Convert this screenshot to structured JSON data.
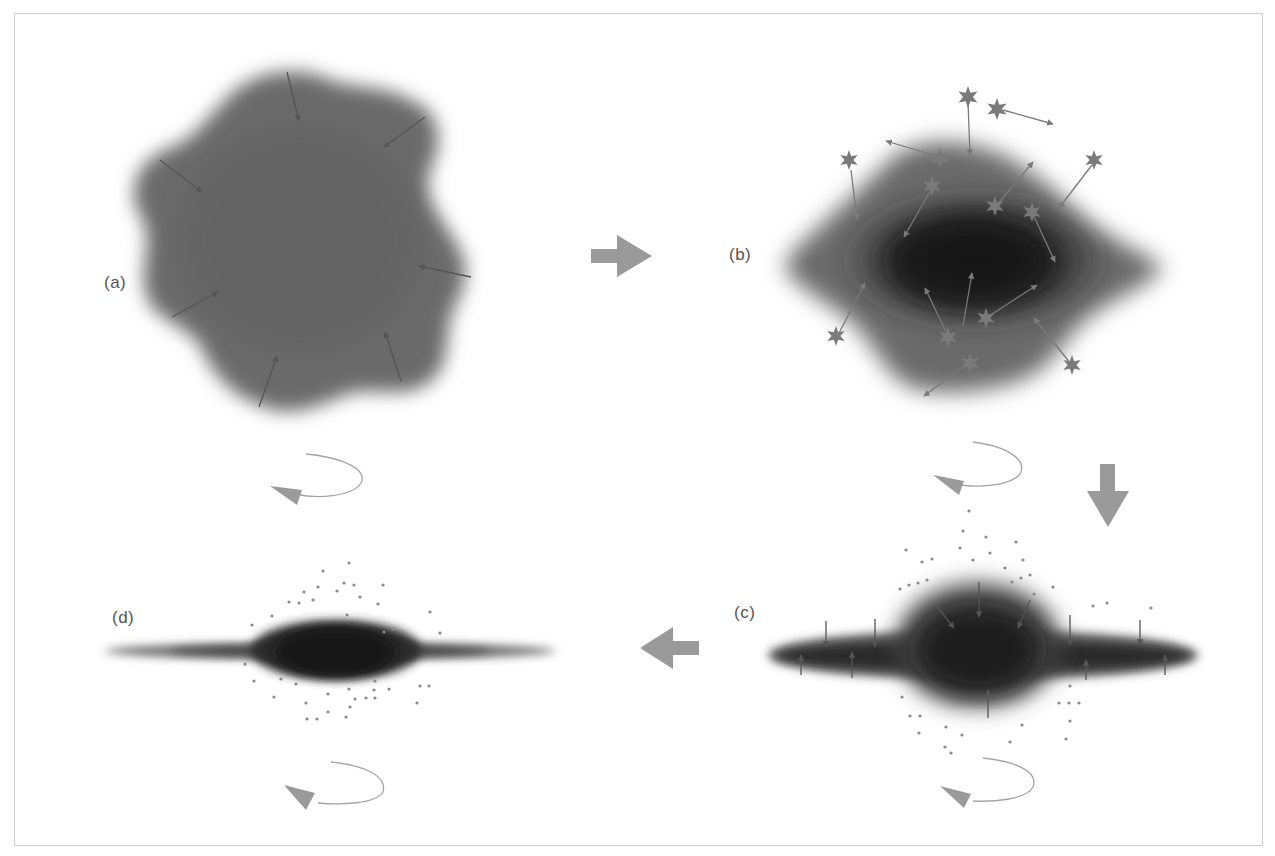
{
  "figure": {
    "panels": [
      {
        "id": "a",
        "label": "(a)",
        "description": "Irregular, lumpy gas cloud collapsing inward (arrows point toward center)"
      },
      {
        "id": "b",
        "label": "(b)",
        "description": "Flattening, denser cloud with newly formed stars (star glyphs) moving on random orbits"
      },
      {
        "id": "c",
        "label": "(c)",
        "description": "Thin rotating disk with central bulge; gas settles into disk plane, scattered halo stars"
      },
      {
        "id": "d",
        "label": "(d)",
        "description": "Final disk galaxy with central bulge and halo stars"
      }
    ],
    "flow_arrows": [
      {
        "from": "a",
        "to": "b",
        "direction": "right"
      },
      {
        "from": "b",
        "to": "c",
        "direction": "down"
      },
      {
        "from": "c",
        "to": "d",
        "direction": "left"
      }
    ],
    "rotation_indicators": [
      "a",
      "b",
      "c",
      "d"
    ],
    "colors": {
      "cloud_dark": "#1e1e1e",
      "cloud_mid": "#6a6a6a",
      "arrow_gray": "#9a9a9a",
      "infall_arrow": "#555555",
      "star": "#7a7a7a",
      "frame": "#cfcfcf"
    }
  }
}
